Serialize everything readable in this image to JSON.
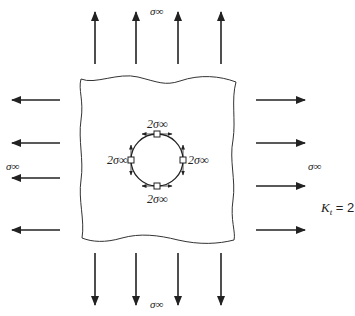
{
  "diagram": {
    "far_field_labels": {
      "top": "σ∞",
      "bottom": "σ∞",
      "left": "σ∞",
      "right": "σ∞"
    },
    "hole_labels": {
      "top": "2σ∞",
      "bottom": "2σ∞",
      "left": "2σ∞",
      "right": "2σ∞"
    },
    "kt_label": {
      "symbol": "K",
      "subscript": "t",
      "value": " = 2"
    },
    "colors": {
      "stroke": "#222222",
      "background": "#ffffff"
    }
  }
}
